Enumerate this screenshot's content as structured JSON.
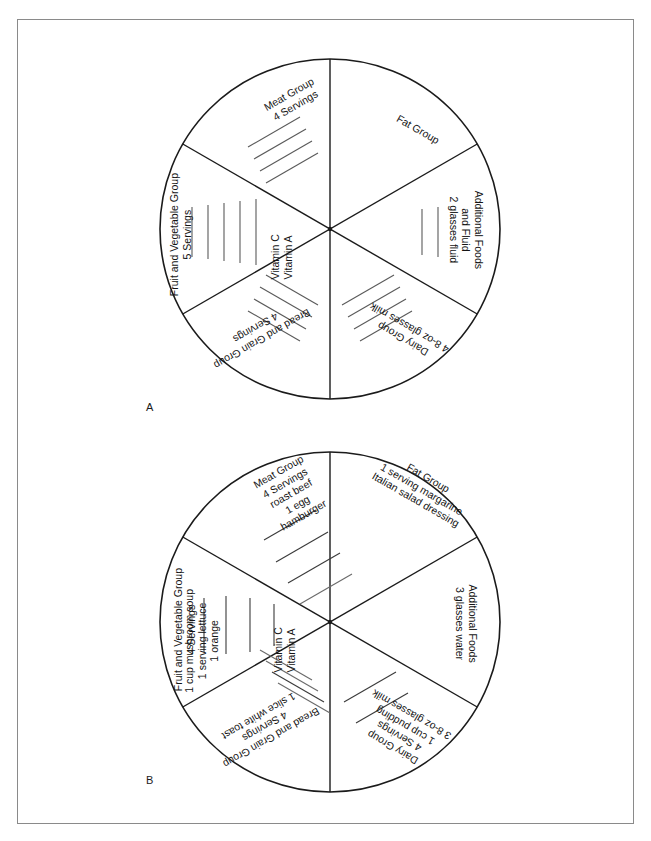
{
  "page": {
    "border_color": "#8a8a8a",
    "line_color": "#1b1b1b",
    "background": "#ffffff"
  },
  "figures": [
    {
      "id": "A",
      "caption": "A",
      "description": "Blank food group circle with servings goals",
      "sectors": [
        {
          "name": "fat-group",
          "position": "top-right",
          "lines": [
            "Fat Group"
          ],
          "blank_tally_count": 0
        },
        {
          "name": "additional-foods",
          "position": "right",
          "lines": [
            "Additional Foods",
            "and Fluid",
            "2 glasses fluid"
          ],
          "blank_tally_count": 2
        },
        {
          "name": "dairy-group",
          "position": "bottom-right",
          "lines": [
            "Dairy Group",
            "4 8-oz glasses milk"
          ],
          "blank_tally_count": 4
        },
        {
          "name": "bread-and-grain-group",
          "position": "bottom-left",
          "lines": [
            "Bread and Grain Group",
            "4 Servings"
          ],
          "blank_tally_count": 4
        },
        {
          "name": "fruit-and-vegetable-group",
          "position": "left",
          "lines": [
            "Fruit and Vegetable Group",
            "5 Servings"
          ],
          "vitamins": [
            "Vitamin C",
            "Vitamin A"
          ],
          "blank_tally_count": 5
        },
        {
          "name": "meat-group",
          "position": "top-left",
          "lines": [
            "Meat Group",
            "4 Servings"
          ],
          "blank_tally_count": 4
        }
      ]
    },
    {
      "id": "B",
      "caption": "B",
      "description": "Completed food group circle with recorded foods",
      "sectors": [
        {
          "name": "fat-group",
          "position": "top-right",
          "lines": [
            "Fat Group",
            "1 serving margarine",
            "Italian salad dressing"
          ],
          "blank_tally_count": 0
        },
        {
          "name": "additional-foods",
          "position": "right",
          "lines": [
            "Additional Foods",
            "3 glasses water"
          ],
          "blank_tally_count": 0
        },
        {
          "name": "dairy-group",
          "position": "bottom-right",
          "lines": [
            "Dairy Group",
            "4 Servings",
            "1 cup pudding",
            "3 8-oz glasses milk"
          ],
          "blank_tally_count": 0
        },
        {
          "name": "bread-and-grain-group",
          "position": "bottom-left",
          "lines": [
            "Bread and Grain Group",
            "4 Servings",
            "1 slice white toast"
          ],
          "blank_tally_count": 3
        },
        {
          "name": "fruit-and-vegetable-group",
          "position": "left",
          "lines": [
            "Fruit and Vegetable Group",
            "4 Servings",
            "1 cup mushroom soup",
            "1 serving lettuce",
            "1 orange"
          ],
          "vitamins": [
            "Vitamin C",
            "Vitamin A"
          ],
          "blank_tally_count": 0
        },
        {
          "name": "meat-group",
          "position": "top-left",
          "lines": [
            "Meat Group",
            "4 Servings",
            "roast beef",
            "1 egg",
            "hamburger"
          ],
          "blank_tally_count": 1
        }
      ]
    }
  ],
  "text": {
    "a": {
      "meat_l1": "Meat Group",
      "meat_l2": "4 Servings",
      "fat_l1": "Fat Group",
      "add_l1": "Additional Foods",
      "add_l2": "and Fluid",
      "add_l3": "2 glasses fluid",
      "dairy_l1": "Dairy Group",
      "dairy_l2": "4 8-oz glasses milk",
      "bread_l1": "Bread and Grain Group",
      "bread_l2": "4 Servings",
      "fruit_l1": "Fruit and Vegetable Group",
      "fruit_l2": "5 Servings",
      "vit_c": "Vitamin C",
      "vit_a": "Vitamin A"
    },
    "b": {
      "meat_l1": "Meat Group",
      "meat_l2": "4 Servings",
      "meat_l3": "roast beef",
      "meat_l4": "1 egg",
      "meat_l5": "hamburger",
      "fat_l1": "Fat Group",
      "fat_l2": "1 serving margarine",
      "fat_l3": "Italian salad dressing",
      "add_l1": "Additional Foods",
      "add_l2": "3 glasses water",
      "dairy_l1": "Dairy Group",
      "dairy_l2": "4 Servings",
      "dairy_l3": "1 cup pudding",
      "dairy_l4": "3 8-oz glasses milk",
      "bread_l1": "Bread and Grain Group",
      "bread_l2": "4 Servings",
      "bread_l3": "1 slice white toast",
      "fruit_l1": "Fruit and Vegetable Group",
      "fruit_l2": "4 Servings",
      "fruit_l3": "1 cup mushroom soup",
      "fruit_l4": "1 serving lettuce",
      "fruit_l5": "1 orange",
      "vit_c": "Vitamin C",
      "vit_a": "Vitamin A"
    }
  },
  "labels": {
    "figure_a": "A",
    "figure_b": "B"
  }
}
